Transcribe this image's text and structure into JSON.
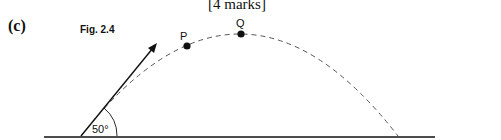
{
  "header": {
    "marks": "[4 marks]",
    "part_label": "(c)"
  },
  "figure": {
    "title": "Fig. 2.4",
    "angle_label": "50°",
    "points": [
      {
        "label": "P"
      },
      {
        "label": "Q"
      }
    ],
    "colors": {
      "ink": "#111111",
      "dash": "#555555"
    }
  }
}
